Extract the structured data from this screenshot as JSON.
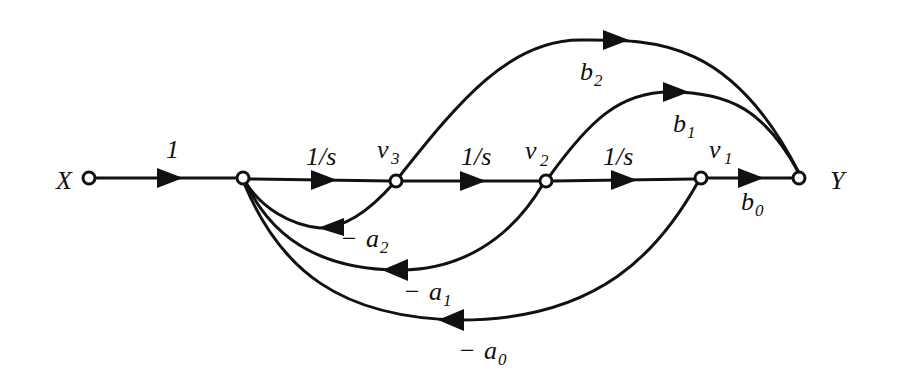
{
  "diagram": {
    "type": "signal-flow-graph",
    "nodes": {
      "input": {
        "label": "X"
      },
      "sum": {
        "label": ""
      },
      "v3": {
        "label": "v",
        "sub": "3"
      },
      "v2": {
        "label": "v",
        "sub": "2"
      },
      "v1": {
        "label": "v",
        "sub": "1"
      },
      "output": {
        "label": "Y"
      }
    },
    "forward_gains": {
      "x_to_sum": "1",
      "sum_to_v3": "1/s",
      "v3_to_v2": "1/s",
      "v2_to_v1": "1/s"
    },
    "feedforward": {
      "b2": {
        "label": "b",
        "sub": "2"
      },
      "b1": {
        "label": "b",
        "sub": "1"
      },
      "b0": {
        "label": "b",
        "sub": "0"
      }
    },
    "feedback": {
      "a2": {
        "prefix": "− ",
        "label": "a",
        "sub": "2"
      },
      "a1": {
        "prefix": "− ",
        "label": "a",
        "sub": "1"
      },
      "a0": {
        "prefix": "− ",
        "label": "a",
        "sub": "0"
      }
    }
  }
}
